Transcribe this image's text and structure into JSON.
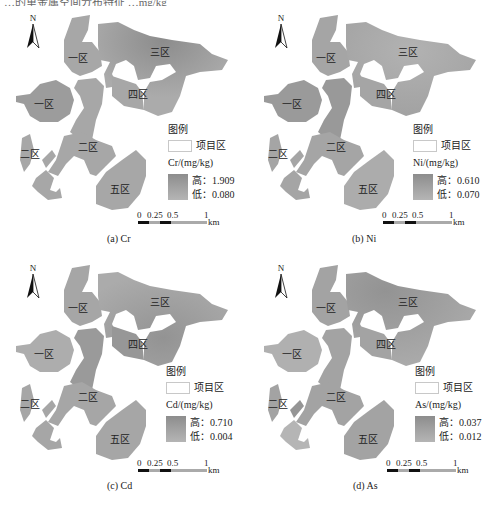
{
  "figure": {
    "top_strip_text": "…的重金属空间分布特征 …mg/kg",
    "panels": [
      {
        "id": "a",
        "caption": "(a)  Cr",
        "element": "Cr",
        "north_label": "N",
        "zones": [
          "一区",
          "一区",
          "三区",
          "四区",
          "二区",
          "二区",
          "五区"
        ],
        "legend": {
          "title": "图例",
          "project_area_label": "项目区",
          "unit_label": "Cr/(mg/kg)",
          "high_label": "高：",
          "high_value": "1.909",
          "low_label": "低：",
          "low_value": "0.080"
        },
        "scale": {
          "ticks": [
            "0",
            "0.25",
            "0.5",
            "1"
          ],
          "unit": "km"
        }
      },
      {
        "id": "b",
        "caption": "(b)  Ni",
        "element": "Ni",
        "north_label": "N",
        "zones": [
          "一区",
          "一区",
          "三区",
          "四区",
          "二区",
          "二区",
          "五区"
        ],
        "legend": {
          "title": "图例",
          "project_area_label": "项目区",
          "unit_label": "Ni/(mg/kg)",
          "high_label": "高：",
          "high_value": "0.610",
          "low_label": "低：",
          "low_value": "0.070"
        },
        "scale": {
          "ticks": [
            "0",
            "0.25",
            "0.5",
            "1"
          ],
          "unit": "km"
        }
      },
      {
        "id": "c",
        "caption": "(c)  Cd",
        "element": "Cd",
        "north_label": "N",
        "zones": [
          "一区",
          "一区",
          "三区",
          "四区",
          "二区",
          "二区",
          "五区"
        ],
        "legend": {
          "title": "图例",
          "project_area_label": "项目区",
          "unit_label": "Cd/(mg/kg)",
          "high_label": "高：",
          "high_value": "0.710",
          "low_label": "低：",
          "low_value": "0.004"
        },
        "scale": {
          "ticks": [
            "0",
            "0.25",
            "0.5",
            "1"
          ],
          "unit": "km"
        }
      },
      {
        "id": "d",
        "caption": "(d)  As",
        "element": "As",
        "north_label": "N",
        "zones": [
          "一区",
          "一区",
          "三区",
          "四区",
          "二区",
          "二区",
          "五区"
        ],
        "legend": {
          "title": "图例",
          "project_area_label": "项目区",
          "unit_label": "As/(mg/kg)",
          "high_label": "高：",
          "high_value": "0.037",
          "low_label": "低：",
          "low_value": "0.012"
        },
        "scale": {
          "ticks": [
            "0",
            "0.25",
            "0.5",
            "1"
          ],
          "unit": "km"
        }
      }
    ],
    "colors": {
      "map_fill_base": "#a9a9a9",
      "map_fill_dark": "#8f8f8f",
      "map_fill_light": "#b9b9b9",
      "background": "#ffffff"
    }
  }
}
